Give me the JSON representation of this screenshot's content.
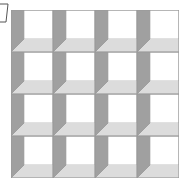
{
  "diagram": {
    "title": "",
    "rows": 4,
    "cols": 4,
    "cell_size": 42,
    "origin": [
      11,
      10
    ],
    "colors": {
      "background": "#ffffff",
      "back_panel": "#ffffff",
      "left_wall": "#a0a0a0",
      "floor": "#dcdcdc",
      "edge": "#7a7a7a",
      "grid_line": "#9a9a9a"
    },
    "corner_mark": "bracket-mark",
    "cells": [
      {
        "row": 0,
        "col": 0
      },
      {
        "row": 0,
        "col": 1
      },
      {
        "row": 0,
        "col": 2
      },
      {
        "row": 0,
        "col": 3
      },
      {
        "row": 1,
        "col": 0
      },
      {
        "row": 1,
        "col": 1
      },
      {
        "row": 1,
        "col": 2
      },
      {
        "row": 1,
        "col": 3
      },
      {
        "row": 2,
        "col": 0
      },
      {
        "row": 2,
        "col": 1
      },
      {
        "row": 2,
        "col": 2
      },
      {
        "row": 2,
        "col": 3
      },
      {
        "row": 3,
        "col": 0
      },
      {
        "row": 3,
        "col": 1
      },
      {
        "row": 3,
        "col": 2
      },
      {
        "row": 3,
        "col": 3
      }
    ]
  }
}
